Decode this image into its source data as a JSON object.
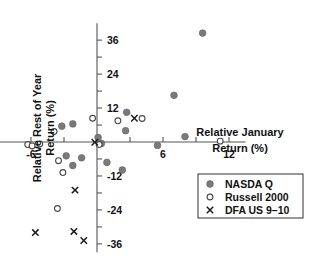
{
  "chart_data": {
    "type": "scatter",
    "title": "",
    "xlabel": "Relative January Return (%)",
    "ylabel": "Relative Rest of Year Return (%)",
    "xlabel_line1": "Relative January",
    "xlabel_line2": "Return (%)",
    "ylabel_line1": "Relative Rest of Year",
    "ylabel_line2": "Return (%)",
    "xlim": [
      -9,
      13.5
    ],
    "ylim": [
      -39,
      42
    ],
    "xticks_major": [
      -6,
      6,
      12
    ],
    "xtick_labels": [
      "-6",
      "6",
      "12"
    ],
    "yticks_major": [
      36,
      24,
      12,
      -12,
      -24,
      -36
    ],
    "ytick_labels": [
      "36",
      "24",
      "12",
      "-12",
      "-24",
      "-36"
    ],
    "xticks_minor": [
      -9,
      -3,
      0,
      3,
      9
    ],
    "yticks_minor": [
      30,
      18,
      6,
      -6,
      -18,
      -30
    ],
    "grid": false,
    "legend_position": "bottom-right",
    "series": [
      {
        "name": "NASDA Q",
        "marker": "filled-circle",
        "color": "#7a7a7a",
        "points": [
          [
            9.6,
            38.5
          ],
          [
            7.0,
            16.5
          ],
          [
            2.7,
            10.5
          ],
          [
            -3.2,
            5.6
          ],
          [
            -2.2,
            6.4
          ],
          [
            2.6,
            4.0
          ],
          [
            0.1,
            1.6
          ],
          [
            8.0,
            1.9
          ],
          [
            5.5,
            -1.2
          ],
          [
            -2.8,
            -4.9
          ],
          [
            -1.4,
            -5.6
          ],
          [
            -2.2,
            -8.3
          ],
          [
            0.9,
            -7.2
          ],
          [
            2.3,
            -9.9
          ],
          [
            0.4,
            -0.5
          ]
        ]
      },
      {
        "name": "Russell 2000",
        "marker": "open-circle",
        "color": "#4a4a4a",
        "points": [
          [
            -0.4,
            8.4
          ],
          [
            1.9,
            7.5
          ],
          [
            4.1,
            8.3
          ],
          [
            -3.9,
            3.7
          ],
          [
            -6.3,
            -0.9
          ],
          [
            -5.9,
            -1.4
          ],
          [
            -5.2,
            -0.7
          ],
          [
            0.2,
            -0.9
          ],
          [
            -3.5,
            -6.6
          ],
          [
            -3.1,
            -10.8
          ],
          [
            -3.6,
            -23.5
          ],
          [
            11.2,
            0.3
          ]
        ]
      },
      {
        "name": "DFA US 9-10",
        "marker": "cross",
        "color": "#1a1a1a",
        "points": [
          [
            3.4,
            8.4
          ],
          [
            -0.2,
            -0.1
          ],
          [
            -2.0,
            -17.0
          ],
          [
            -2.1,
            -31.6
          ],
          [
            -5.6,
            -32.0
          ],
          [
            -1.2,
            -34.8
          ]
        ]
      }
    ]
  },
  "legend": {
    "items": [
      {
        "label": "NASDA Q",
        "marker": "filled-circle"
      },
      {
        "label": "Russell 2000",
        "marker": "open-circle"
      },
      {
        "label": "DFA US 9–10",
        "marker": "cross"
      }
    ]
  }
}
